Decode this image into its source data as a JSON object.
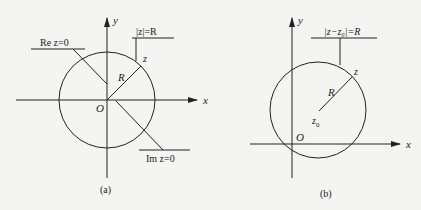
{
  "figure": {
    "colors": {
      "background": "#f4f4f2",
      "ink": "#222222"
    },
    "panels": [
      {
        "id": "a",
        "caption": "(a)",
        "axis_labels": {
          "x": "x",
          "y": "y"
        },
        "origin_label": "O",
        "radius_label": "R",
        "point_label": "z",
        "annotations": {
          "circle": "|z|=R",
          "imag_axis": "Re z=0",
          "real_axis": "Im z=0"
        }
      },
      {
        "id": "b",
        "caption": "(b)",
        "axis_labels": {
          "x": "x",
          "y": "y"
        },
        "origin_label": "O",
        "radius_label": "R",
        "point_label": "z",
        "center_label": "z",
        "center_subscript": "0",
        "annotations": {
          "circle": "|z−z₀|=R"
        }
      }
    ]
  }
}
